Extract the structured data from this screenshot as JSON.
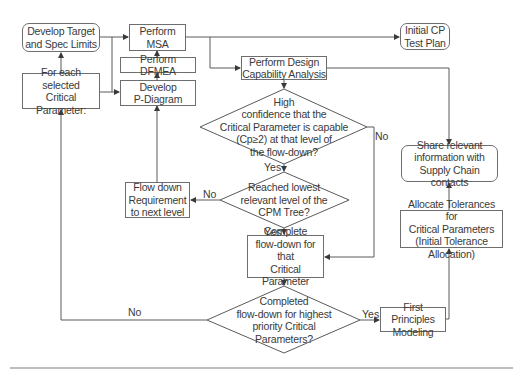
{
  "nodes": {
    "develop_target": "Develop Target\nand Spec Limits",
    "for_each": "For each selected\nCritical\nParameter:",
    "perform_msa": "Perform\nMSA",
    "perform_dfmea": "Perform DFMEA",
    "develop_pdiagram": "Develop\nP-Diagram",
    "design_capability": "Perform Design\nCapability Analysis",
    "initial_cp": "Initial CP\nTest Plan",
    "decision_high_confidence": "High\nconfidence that the\nCritical Parameter is capable\n(Cp≥2) at that level of\nthe flow-down?",
    "flow_down_requirement": "Flow down\nRequirement\nto next level",
    "decision_lowest_level": "Reached lowest\nrelevant level of the\nCPM Tree?",
    "complete_flowdown": "Complete\nflow-down for that\nCritical Parameter",
    "decision_completed": "Completed\nflow-down for highest\npriority Critical\nParameters?",
    "first_principles": "First Principles\nModeling",
    "share_info": "Share relevant\ninformation with\nSupply Chain contacts",
    "allocate_tolerances": "Allocate Tolerances for\nCritical Parameters\n(Initial Tolerance Allocation)"
  },
  "labels": {
    "no_high_confidence": "No",
    "yes_high_confidence": "Yes",
    "no_lowest_level": "No",
    "yes_lowest_level": "Yes",
    "no_completed": "No",
    "yes_completed": "Yes"
  },
  "colors": {
    "line": "#5a5a5a",
    "border": "#6e6e6e",
    "text": "#3a3a3a",
    "rule": "#bdbdbd"
  }
}
